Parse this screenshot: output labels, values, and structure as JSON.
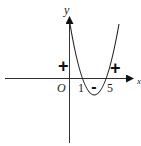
{
  "diagram": {
    "type": "function-sign-graph",
    "axes": {
      "x_label": "x",
      "y_label": "y",
      "origin_label": "O"
    },
    "roots": [
      "1",
      "5"
    ],
    "sign_labels": {
      "left": "+",
      "middle": "-",
      "right": "+"
    },
    "colors": {
      "stroke": "#222222",
      "background": "#ffffff"
    }
  }
}
